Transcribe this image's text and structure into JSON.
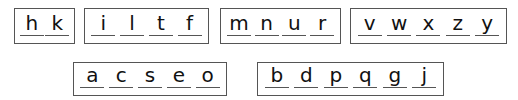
{
  "groups": [
    {
      "letters": [
        "h",
        "k"
      ]
    },
    {
      "letters": [
        "i",
        "l",
        "t",
        "f"
      ]
    },
    {
      "letters": [
        "m",
        "n",
        "u",
        "r"
      ]
    },
    {
      "letters": [
        "v",
        "w",
        "x",
        "z",
        "y"
      ]
    },
    {
      "letters": [
        "a",
        "c",
        "s",
        "e",
        "o"
      ]
    },
    {
      "letters": [
        "b",
        "d",
        "p",
        "q",
        "g",
        "j"
      ]
    }
  ],
  "colors": {
    "border": "#555555",
    "text": "#111111",
    "background": "#ffffff"
  }
}
